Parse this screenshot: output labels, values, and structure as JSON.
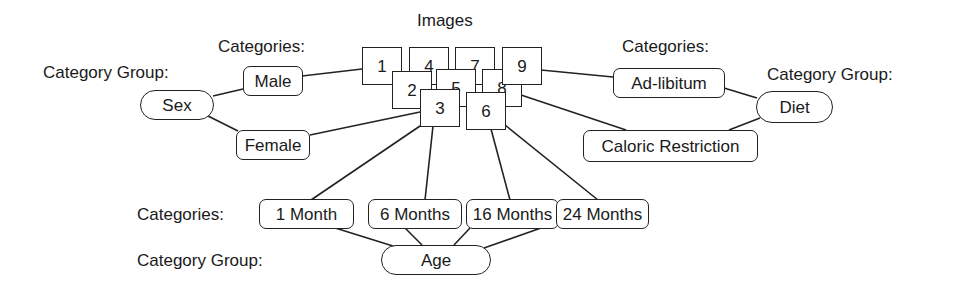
{
  "title": "Images",
  "labels": {
    "categories": "Categories:",
    "category_group": "Category Group:"
  },
  "images": [
    "1",
    "2",
    "3",
    "4",
    "5",
    "6",
    "7",
    "8",
    "9"
  ],
  "groups": {
    "sex": {
      "name": "Sex",
      "categories": [
        "Male",
        "Female"
      ]
    },
    "diet": {
      "name": "Diet",
      "categories": [
        "Ad-libitum",
        "Caloric Restriction"
      ]
    },
    "age": {
      "name": "Age",
      "categories": [
        "1 Month",
        "6 Months",
        "16 Months",
        "24 Months"
      ]
    }
  },
  "colors": {
    "stroke": "#222222",
    "background": "#ffffff"
  }
}
